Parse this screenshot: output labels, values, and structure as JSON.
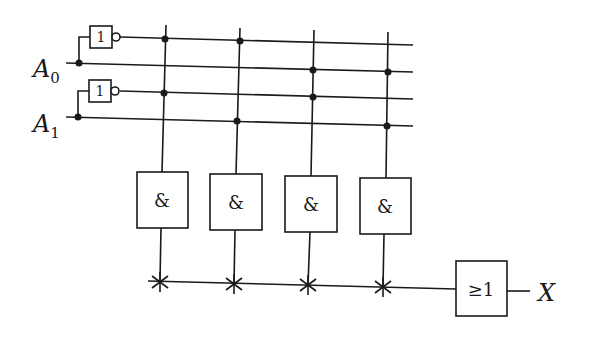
{
  "diagram": {
    "type": "logic-circuit",
    "inputs": [
      {
        "name": "A",
        "subscript": "0"
      },
      {
        "name": "A",
        "subscript": "1"
      }
    ],
    "not_gates": [
      {
        "symbol": "1"
      },
      {
        "symbol": "1"
      }
    ],
    "and_gates": [
      {
        "symbol": "&"
      },
      {
        "symbol": "&"
      },
      {
        "symbol": "&"
      },
      {
        "symbol": "&"
      }
    ],
    "or_gate": {
      "symbol": "≥1"
    },
    "output": {
      "name": "X"
    }
  }
}
